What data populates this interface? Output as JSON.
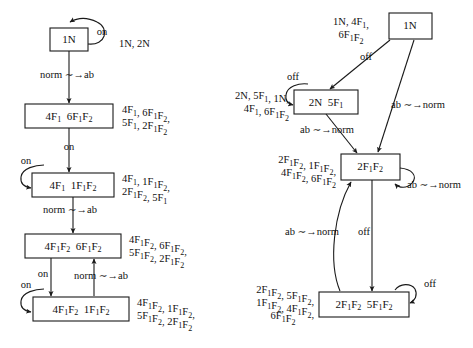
{
  "figure": {
    "transition_symbol": "~→",
    "left_diagram": {
      "name": "left-state-diagram",
      "nodes": [
        {
          "id": "L1",
          "label": "1N",
          "parts": [
            "1N"
          ]
        },
        {
          "id": "L2",
          "label": "4F1 6F1F2",
          "parts": [
            "4F",
            "1",
            " 6F",
            "1",
            "F",
            "2"
          ]
        },
        {
          "id": "L3",
          "label": "4F1 1F1F2",
          "parts": [
            "4F",
            "1",
            " 1F",
            "1",
            "F",
            "2"
          ]
        },
        {
          "id": "L4",
          "label": "4F1F2 6F1F2",
          "parts": [
            "4F",
            "1",
            "F",
            "2",
            " 6F",
            "1",
            "F",
            "2"
          ]
        },
        {
          "id": "L5",
          "label": "4F1F2 1F1F2",
          "parts": [
            "4F",
            "1",
            "F",
            "2",
            " 1F",
            "1",
            "F",
            "2"
          ]
        }
      ],
      "edges": [
        {
          "from": "L1",
          "to": "L1",
          "label": "on",
          "kind": "self-loop"
        },
        {
          "from": "L1",
          "to": "L2",
          "label": "norm ∼→ab",
          "kind": "down"
        },
        {
          "from": "L2",
          "to": "L3",
          "label": "on",
          "kind": "down"
        },
        {
          "from": "L3",
          "to": "L3",
          "label": "on",
          "kind": "self-loop"
        },
        {
          "from": "L3",
          "to": "L4",
          "label": "norm ∼→ab",
          "kind": "down"
        },
        {
          "from": "L4",
          "to": "L5",
          "label": "on",
          "kind": "down"
        },
        {
          "from": "L5",
          "to": "L4",
          "label": "norm ∼→ab",
          "kind": "up"
        },
        {
          "from": "L5",
          "to": "L5",
          "label": "on",
          "kind": "self-loop"
        }
      ],
      "annotations": [
        {
          "for": "L1",
          "lines": [
            "1N, 2N"
          ]
        },
        {
          "for": "L2",
          "lines": [
            "4F1, 6F1F2,",
            "5F1, 2F1F2"
          ]
        },
        {
          "for": "L3",
          "lines": [
            "4F1, 1F1F2,",
            "2F1F2, 5F1"
          ]
        },
        {
          "for": "L4",
          "lines": [
            "4F1F2, 6F1F2,",
            "5F1F2, 2F1F2"
          ]
        },
        {
          "for": "L5",
          "lines": [
            "4F1F2, 1F1F2,",
            "5F1F2, 2F1F2"
          ]
        }
      ]
    },
    "right_diagram": {
      "name": "right-state-diagram",
      "nodes": [
        {
          "id": "R1",
          "label": "1N",
          "parts": [
            "1N"
          ]
        },
        {
          "id": "R2",
          "label": "2N 5F1",
          "parts": [
            "2N  5F",
            "1"
          ]
        },
        {
          "id": "R3",
          "label": "2F1F2",
          "parts": [
            "2F",
            "1",
            "F",
            "2"
          ]
        },
        {
          "id": "R4",
          "label": "2F1F2 5F1F2",
          "parts": [
            "2F",
            "1",
            "F",
            "2",
            "  5F",
            "1",
            "F",
            "2"
          ]
        }
      ],
      "edges": [
        {
          "from": "R1",
          "to": "R2",
          "label": "off",
          "kind": "diagonal"
        },
        {
          "from": "R1",
          "to": "R3",
          "label": "ab ∼→norm",
          "kind": "diagonal"
        },
        {
          "from": "R2",
          "to": "R2",
          "label": "off",
          "kind": "self-loop"
        },
        {
          "from": "R2",
          "to": "R3",
          "label": "ab ∼→norm",
          "kind": "down"
        },
        {
          "from": "R3",
          "to": "R3",
          "label": "ab ∼→norm",
          "kind": "self-loop"
        },
        {
          "from": "R3",
          "to": "R4",
          "label": "off",
          "kind": "down"
        },
        {
          "from": "R4",
          "to": "R3",
          "label": "ab ∼→norm",
          "kind": "up"
        },
        {
          "from": "R4",
          "to": "R4",
          "label": "off",
          "kind": "self-loop"
        }
      ],
      "annotations": [
        {
          "for": "R1",
          "lines": [
            "1N, 4F1,",
            "6F1F2"
          ]
        },
        {
          "for": "R2",
          "lines": [
            "2N, 5F1, 1N,",
            "4F1, 6F1F2"
          ]
        },
        {
          "for": "R3",
          "lines": [
            "2F1F2, 1F1F2,",
            "4F1F2, 6F1F2"
          ]
        },
        {
          "for": "R4",
          "lines": [
            "2F1F2, 5F1F2,",
            "1F1F2, 4F1F2,",
            "6F1F2"
          ]
        }
      ]
    },
    "text": {
      "on": "on",
      "off": "off",
      "norm_to_ab": "norm ∼→ab",
      "ab_to_norm": "ab ∼→norm",
      "n1": "1N",
      "n1_ann": "1N, 2N",
      "l2_box_a": "4F",
      "l2_box_b": "6F",
      "l2_ann_1": "4F1, 6F1F2,",
      "l2_ann_2": "5F1, 2F1F2",
      "l3_ann_1": "4F1, 1F1F2,",
      "l3_ann_2": "2F1F2, 5F1",
      "l4_ann_1": "4F1F2, 6F1F2,",
      "l4_ann_2": "5F1F2, 2F1F2",
      "l5_ann_1": "4F1F2, 1F1F2,",
      "l5_ann_2": "5F1F2, 2F1F2",
      "r1_ann_1": "1N, 4F1,",
      "r1_ann_2": "6F1F2",
      "r2_ann_1": "2N, 5F1, 1N,",
      "r2_ann_2": "4F1, 6F1F2",
      "r3_ann_1": "2F1F2, 1F1F2,",
      "r3_ann_2": "4F1F2, 6F1F2",
      "r4_ann_1": "2F1F2, 5F1F2,",
      "r4_ann_2": "1F1F2, 4F1F2,",
      "r4_ann_3": "6F1F2"
    },
    "colors": {
      "ink": "#1a1a1a",
      "paper": "#ffffff"
    }
  }
}
